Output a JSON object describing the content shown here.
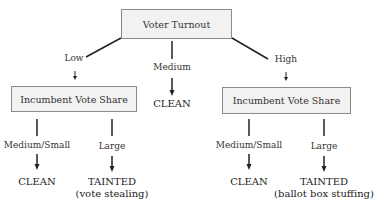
{
  "root": {
    "label": "Voter Turnout"
  },
  "branches": [
    {
      "label": "Low",
      "node": "Incumbent Vote Share",
      "children": [
        {
          "label": "Medium/Small",
          "outcome": "CLEAN",
          "note": ""
        },
        {
          "label": "Large",
          "outcome": "TAINTED",
          "note": "(vote stealing)"
        }
      ]
    },
    {
      "label": "Medium",
      "outcome": "CLEAN"
    },
    {
      "label": "High",
      "node": "Incumbent Vote Share",
      "children": [
        {
          "label": "Medium/Small",
          "outcome": "CLEAN",
          "note": ""
        },
        {
          "label": "Large",
          "outcome": "TAINTED",
          "note": "(ballot box stuffing)"
        }
      ]
    }
  ],
  "colors": {
    "box_fill": "#f2f2f2",
    "box_border": "#8a8a8a",
    "line": "#222222"
  }
}
